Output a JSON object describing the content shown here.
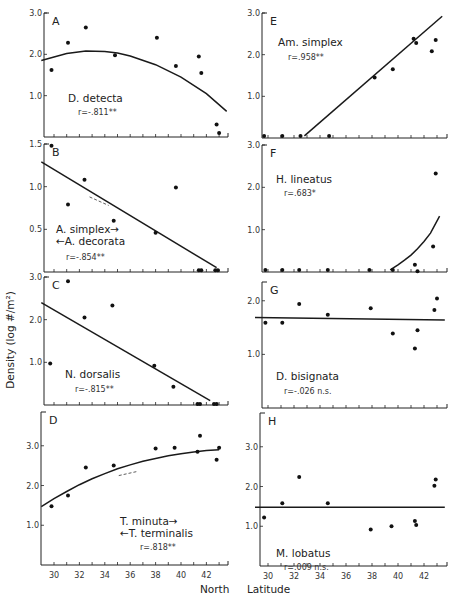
{
  "chart_data": {
    "type": "scatter",
    "ylabel": "Density (log #/m²)",
    "xlabel": "North Latitude",
    "xticks": [
      30,
      32,
      34,
      36,
      38,
      40,
      42
    ],
    "xlim": [
      29,
      43.7
    ],
    "panels": [
      {
        "id": "A",
        "species": [
          "D. detecta"
        ],
        "r": "r=-.811**",
        "ylim": [
          0,
          3.0
        ],
        "yticks": [
          1.0,
          2.0,
          3.0
        ],
        "yticklabels": [
          "1.0",
          "2.0",
          "3.0"
        ],
        "points": [
          [
            29.8,
            1.62
          ],
          [
            31.1,
            2.28
          ],
          [
            32.5,
            2.65
          ],
          [
            34.8,
            1.98
          ],
          [
            38.1,
            2.4
          ],
          [
            39.6,
            1.72
          ],
          [
            41.4,
            1.95
          ],
          [
            41.6,
            1.55
          ],
          [
            42.8,
            0.3
          ],
          [
            43.0,
            0.1
          ]
        ],
        "fit": {
          "kind": "quadratic",
          "x": [
            29,
            31,
            32.5,
            34,
            35,
            36,
            38,
            40,
            42,
            43.6
          ],
          "y": [
            1.85,
            2.02,
            2.08,
            2.07,
            2.03,
            1.96,
            1.75,
            1.45,
            1.05,
            0.62
          ]
        },
        "label_pos": [
          68,
          102
        ],
        "r_pos": [
          78,
          115
        ]
      },
      {
        "id": "B",
        "species": [
          "A. simplex→",
          "←A. decorata"
        ],
        "r": "r=-.854**",
        "ylim": [
          0,
          1.5
        ],
        "yticks": [
          0.5,
          1.0,
          1.5
        ],
        "yticklabels": [
          "0.5",
          "1.0",
          "1.5"
        ],
        "points": [
          [
            29.8,
            1.48
          ],
          [
            31.1,
            0.79
          ],
          [
            32.4,
            1.08
          ],
          [
            34.7,
            0.6
          ],
          [
            38.0,
            0.46
          ],
          [
            39.6,
            0.99
          ],
          [
            41.4,
            0.02
          ],
          [
            41.6,
            0.02
          ],
          [
            42.7,
            0.02
          ],
          [
            42.9,
            0.02
          ]
        ],
        "fit": {
          "kind": "linear",
          "x": [
            29,
            42.8
          ],
          "y": [
            1.29,
            0.05
          ]
        },
        "label_pos": [
          56,
          233
        ],
        "r_pos": [
          66,
          260
        ]
      },
      {
        "id": "C",
        "species": [
          "N. dorsalis"
        ],
        "r": "r=-.815**",
        "ylim": [
          0,
          3.0
        ],
        "yticks": [
          1.0,
          2.0,
          3.0
        ],
        "yticklabels": [
          "1.0",
          "2.0",
          "3.0"
        ],
        "points": [
          [
            29.7,
            0.97
          ],
          [
            31.1,
            2.9
          ],
          [
            32.4,
            2.05
          ],
          [
            34.6,
            2.33
          ],
          [
            37.9,
            0.92
          ],
          [
            39.4,
            0.43
          ],
          [
            41.3,
            0.02
          ],
          [
            41.5,
            0.02
          ],
          [
            42.6,
            0.02
          ],
          [
            42.8,
            0.02
          ]
        ],
        "fit": {
          "kind": "linear",
          "x": [
            29,
            42.3
          ],
          "y": [
            2.4,
            0.1
          ]
        },
        "label_pos": [
          65,
          378
        ],
        "r_pos": [
          75,
          392
        ]
      },
      {
        "id": "D",
        "species": [
          "T. minuta→",
          "←T. terminalis"
        ],
        "r": "r=.818**",
        "ylim": [
          0,
          3.85
        ],
        "yticks": [
          1.0,
          2.0,
          3.0
        ],
        "yticklabels": [
          "1.0",
          "2.0",
          "3.0"
        ],
        "points": [
          [
            29.8,
            1.48
          ],
          [
            31.1,
            1.75
          ],
          [
            32.5,
            2.45
          ],
          [
            34.7,
            2.5
          ],
          [
            38.0,
            2.93
          ],
          [
            39.5,
            2.95
          ],
          [
            41.3,
            2.85
          ],
          [
            41.5,
            3.25
          ],
          [
            42.8,
            2.65
          ],
          [
            43.0,
            2.95
          ]
        ],
        "fit": {
          "kind": "exponential",
          "x": [
            29,
            30,
            31,
            32,
            33,
            34,
            35,
            36,
            37,
            38,
            39,
            40,
            41,
            42,
            43
          ],
          "y": [
            1.47,
            1.67,
            1.85,
            2.02,
            2.17,
            2.3,
            2.42,
            2.52,
            2.61,
            2.68,
            2.75,
            2.8,
            2.84,
            2.88,
            2.9
          ]
        },
        "label_pos": [
          120,
          525
        ],
        "r_pos": [
          140,
          550
        ]
      },
      {
        "id": "E",
        "species": [
          "Am. simplex"
        ],
        "r": "r=.958**",
        "ylim": [
          0,
          3.0
        ],
        "yticks": [
          1.0,
          2.0,
          3.0
        ],
        "yticklabels": [
          "1.0",
          "2.0",
          "3.0"
        ],
        "points": [
          [
            29.7,
            0.05
          ],
          [
            31.1,
            0.05
          ],
          [
            32.5,
            0.05
          ],
          [
            34.7,
            0.05
          ],
          [
            38.2,
            1.45
          ],
          [
            39.6,
            1.65
          ],
          [
            41.2,
            2.38
          ],
          [
            41.4,
            2.28
          ],
          [
            42.6,
            2.08
          ],
          [
            42.9,
            2.35
          ]
        ],
        "fit": {
          "kind": "linear",
          "x": [
            32.8,
            43.4
          ],
          "y": [
            0.05,
            2.92
          ]
        },
        "label_pos": [
          278,
          46
        ],
        "r_pos": [
          288,
          60
        ]
      },
      {
        "id": "F",
        "species": [
          "H. lineatus"
        ],
        "r": "r=.683*",
        "ylim": [
          0,
          3.0
        ],
        "yticks": [
          1.0,
          2.0,
          3.0
        ],
        "yticklabels": [
          "1.0",
          "2.0",
          "3.0"
        ],
        "points": [
          [
            29.8,
            0.05
          ],
          [
            31.1,
            0.05
          ],
          [
            32.4,
            0.05
          ],
          [
            34.6,
            0.05
          ],
          [
            37.8,
            0.05
          ],
          [
            39.6,
            0.05
          ],
          [
            41.3,
            0.17
          ],
          [
            41.5,
            0.02
          ],
          [
            42.7,
            0.6
          ],
          [
            42.9,
            2.33
          ]
        ],
        "fit": {
          "kind": "exponential",
          "x": [
            39.4,
            40,
            40.5,
            41,
            41.5,
            42,
            42.5,
            43.2
          ],
          "y": [
            0.05,
            0.17,
            0.28,
            0.4,
            0.55,
            0.72,
            0.92,
            1.32
          ]
        },
        "label_pos": [
          276,
          183
        ],
        "r_pos": [
          284,
          196
        ]
      },
      {
        "id": "G",
        "species": [
          "D. bisignata"
        ],
        "r": "r=-.026 n.s.",
        "ylim": [
          0,
          2.35
        ],
        "yticks": [
          1.0,
          2.0
        ],
        "yticklabels": [
          "1.0",
          "2.0"
        ],
        "points": [
          [
            29.8,
            1.59
          ],
          [
            31.1,
            1.59
          ],
          [
            32.4,
            1.94
          ],
          [
            34.6,
            1.74
          ],
          [
            37.9,
            1.86
          ],
          [
            39.6,
            1.39
          ],
          [
            41.3,
            1.11
          ],
          [
            41.5,
            1.45
          ],
          [
            42.8,
            1.83
          ],
          [
            43.0,
            2.04
          ]
        ],
        "fit": {
          "kind": "linear",
          "x": [
            29,
            43.6
          ],
          "y": [
            1.69,
            1.64
          ]
        },
        "label_pos": [
          276,
          380
        ],
        "r_pos": [
          284,
          394
        ]
      },
      {
        "id": "H",
        "species": [
          "M. lobatus"
        ],
        "r": "r=.009 n.s.",
        "ylim": [
          0,
          3.85
        ],
        "yticks": [
          1.0,
          2.0,
          3.0
        ],
        "yticklabels": [
          "1.0",
          "2.0",
          "3.0"
        ],
        "points": [
          [
            29.7,
            1.22
          ],
          [
            31.1,
            1.58
          ],
          [
            32.4,
            2.24
          ],
          [
            34.6,
            1.58
          ],
          [
            37.9,
            0.92
          ],
          [
            39.5,
            1.0
          ],
          [
            41.3,
            1.13
          ],
          [
            41.4,
            1.03
          ],
          [
            42.8,
            2.02
          ],
          [
            42.9,
            2.18
          ]
        ],
        "fit": {
          "kind": "linear",
          "x": [
            29,
            43.6
          ],
          "y": [
            1.48,
            1.48
          ]
        },
        "label_pos": [
          276,
          557
        ],
        "r_pos": [
          284,
          570
        ]
      }
    ]
  },
  "labels": {
    "ylabel": "Density  (log #/m²)",
    "xlabel_left": "North",
    "xlabel_right": "Latitude"
  }
}
